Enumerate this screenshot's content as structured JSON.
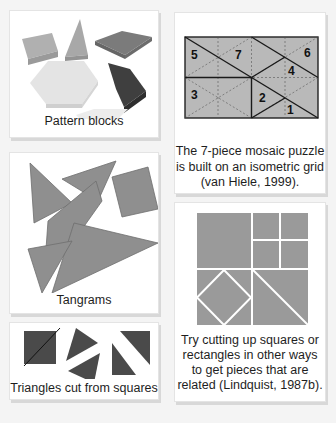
{
  "panels": {
    "pattern_blocks": {
      "caption": "Pattern blocks"
    },
    "mosaic": {
      "caption_lines": [
        "The 7-piece mosaic puzzle",
        "is built on an isometric grid",
        "(van Hiele, 1999)."
      ],
      "piece_numbers": [
        "1",
        "2",
        "3",
        "4",
        "5",
        "6",
        "7"
      ]
    },
    "tangrams": {
      "caption": "Tangrams"
    },
    "cut_squares": {
      "caption_lines": [
        "Try cutting up squares or",
        "rectangles in other ways",
        "to get pieces that are",
        "related (Lindquist, 1987b)."
      ]
    },
    "triangles": {
      "caption": "Triangles cut from squares"
    }
  },
  "colors": {
    "background": "#f4f4f4",
    "card": "#ffffff",
    "mid_gray": "#8f8f8f",
    "dark_gray": "#4a4a4a",
    "light_gray": "#e6e6e6",
    "mosaic_fill": "#b9b9b9"
  }
}
